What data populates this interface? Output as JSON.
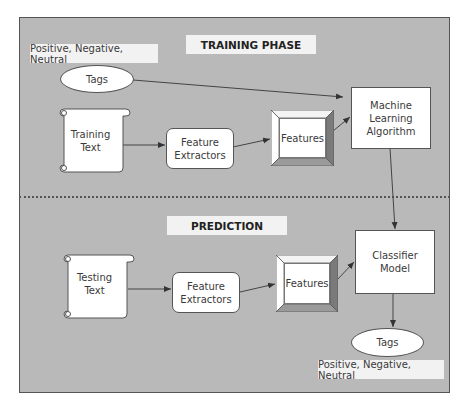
{
  "diagram": {
    "training_phase": {
      "title": "TRAINING PHASE",
      "tags_values": "Positive, Negative, Neutral",
      "tags_node": "Tags",
      "input_node": [
        "Training",
        "Text"
      ],
      "extractor_node": [
        "Feature",
        "Extractors"
      ],
      "features_node": "Features",
      "algorithm_node": [
        "Machine",
        "Learning",
        "Algorithm"
      ]
    },
    "prediction_phase": {
      "title": "PREDICTION",
      "input_node": [
        "Testing",
        "Text"
      ],
      "extractor_node": [
        "Feature",
        "Extractors"
      ],
      "features_node": "Features",
      "model_node": [
        "Classifier",
        "Model"
      ],
      "tags_node": "Tags",
      "tags_values": "Positive, Negative, Neutral"
    },
    "edges": [
      {
        "from": "Tags",
        "to": "Machine Learning Algorithm"
      },
      {
        "from": "Training Text",
        "to": "Feature Extractors"
      },
      {
        "from": "Feature Extractors",
        "to": "Features"
      },
      {
        "from": "Features",
        "to": "Machine Learning Algorithm"
      },
      {
        "from": "Machine Learning Algorithm",
        "to": "Classifier Model"
      },
      {
        "from": "Testing Text",
        "to": "Feature Extractors (prediction)"
      },
      {
        "from": "Feature Extractors (prediction)",
        "to": "Features (prediction)"
      },
      {
        "from": "Features (prediction)",
        "to": "Classifier Model"
      },
      {
        "from": "Classifier Model",
        "to": "Tags (prediction)"
      }
    ],
    "colors": {
      "panel_bg": "#b9b9b9",
      "node_bg": "#ffffff",
      "label_bg": "#f2f2f2",
      "stroke": "#444444"
    }
  }
}
